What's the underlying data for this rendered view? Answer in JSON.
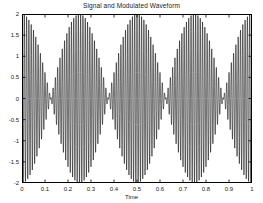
{
  "chart_data": {
    "type": "line",
    "title": "Signal and Modulated Waveform",
    "xlabel": "Time",
    "ylabel": "",
    "xlim": [
      0,
      1
    ],
    "ylim": [
      -2,
      2
    ],
    "grid": false,
    "legend": null,
    "line_color": "#000000",
    "background_color": "#ffffff",
    "axis_color": "#000000",
    "xticks": [
      0,
      0.1,
      0.2,
      0.3,
      0.4,
      0.5,
      0.6,
      0.7,
      0.8,
      0.9,
      1
    ],
    "xticklabels": [
      "0",
      "0.1",
      "0.2",
      "0.3",
      "0.4",
      "0.5",
      "0.6",
      "0.7",
      "0.8",
      "0.9",
      "1"
    ],
    "yticks": [
      -2,
      -1.5,
      -1,
      -0.5,
      0,
      0.5,
      1,
      1.5,
      2
    ],
    "yticklabels": [
      "-2",
      "-1.5",
      "-1",
      "-0.5",
      "0",
      "0.5",
      "1",
      "1.5",
      "2"
    ],
    "series": [
      {
        "name": "Modulated Waveform",
        "description": "Amplitude-modulated carrier: 2*cos(2*pi*2*t)*cos(2*pi*100*t)",
        "envelope_amplitude": 2,
        "envelope_frequency_hz": 2,
        "carrier_frequency_hz": 100,
        "samples": 2000,
        "envelope_maxima_t": [
          0,
          0.5,
          1
        ],
        "envelope_nodes_t": [
          0.25,
          0.75
        ],
        "peak_value": 2,
        "min_value": -2
      }
    ],
    "annotations": []
  }
}
